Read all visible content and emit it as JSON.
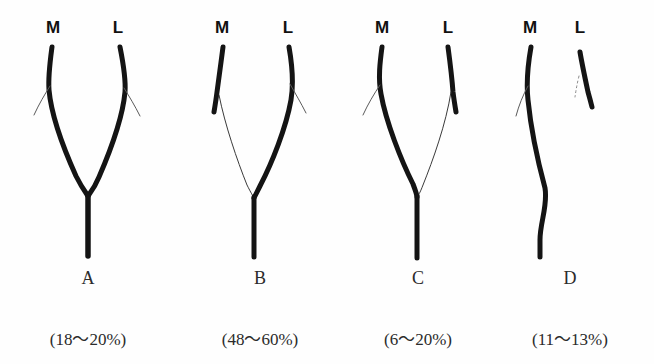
{
  "figure": {
    "kind": "anatomical-branching-diagram",
    "background_color": "#fefefe",
    "ink_color": "#141414",
    "faint_ink_color": "#3a3a3a",
    "panel_count": 4
  },
  "panels": [
    {
      "id": "A",
      "type_letter": "A",
      "prevalence": "(18～20%)",
      "medial_label": "M",
      "lateral_label": "L",
      "medial_caliber": "thick",
      "lateral_caliber": "thick",
      "description": "Symmetric bifurcation: both medial and lateral branches equally dominant, joining a common trunk"
    },
    {
      "id": "B",
      "type_letter": "B",
      "prevalence": "(48～60%)",
      "medial_label": "M",
      "lateral_label": "L",
      "medial_caliber": "thin",
      "lateral_caliber": "thick",
      "description": "Lateral dominant: medial branch hypoplastic, continues as a fine thread to the trunk"
    },
    {
      "id": "C",
      "type_letter": "C",
      "prevalence": "(6～20%)",
      "medial_label": "M",
      "lateral_label": "L",
      "medial_caliber": "thick",
      "lateral_caliber": "thin",
      "description": "Medial dominant: lateral branch hypoplastic, continues as a fine thread to the trunk"
    },
    {
      "id": "D",
      "type_letter": "D",
      "prevalence": "(11～13%)",
      "medial_label": "M",
      "lateral_label": "L",
      "medial_caliber": "thick",
      "lateral_caliber": "absent",
      "description": "Medial only: lateral branch does not join the trunk, remains a separate short stump"
    }
  ]
}
